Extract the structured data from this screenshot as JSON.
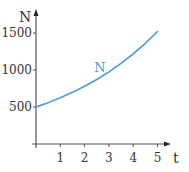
{
  "chart_data": {
    "type": "line",
    "title": "",
    "xlabel": "t",
    "ylabel": "N",
    "xlim": [
      0,
      5.5
    ],
    "ylim": [
      0,
      1600
    ],
    "x_ticks": [
      1,
      2,
      3,
      4,
      5
    ],
    "x_tick_labels": [
      "1",
      "2",
      "3",
      "4",
      "5"
    ],
    "y_ticks": [
      500,
      1000,
      1500
    ],
    "y_tick_labels": [
      "500",
      "1000",
      "1500"
    ],
    "grid": false,
    "legend": null,
    "series": [
      {
        "name": "N",
        "color": "#4a9ad4",
        "x": [
          0,
          0.5,
          1,
          1.5,
          2,
          2.5,
          3,
          3.5,
          4,
          4.5,
          5
        ],
        "values": [
          500,
          559,
          625,
          698,
          780,
          872,
          975,
          1090,
          1218,
          1361,
          1520
        ]
      }
    ],
    "annotations": [
      {
        "text": "N",
        "x": 2.4,
        "y": 1000,
        "color": "#4a9ad4"
      }
    ]
  }
}
